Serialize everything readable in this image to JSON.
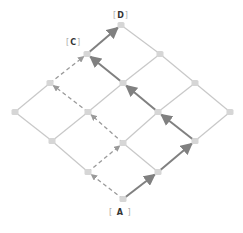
{
  "diagram": {
    "type": "lattice-path",
    "colors": {
      "grid_edge": "#c8c8c8",
      "node": "#d6d6d6",
      "solid_path": "#808080",
      "dashed_path": "#9a9a9a",
      "label_text": "#333333"
    },
    "labels": [
      {
        "id": "D",
        "text": "D",
        "x": 113,
        "y": 12
      },
      {
        "id": "C",
        "text": "C",
        "x": 66,
        "y": 39
      },
      {
        "id": "A",
        "text": "A",
        "x": 109,
        "y": 209
      }
    ],
    "nodes": [
      {
        "id": "n00",
        "x": 123,
        "y": 199
      },
      {
        "id": "n10",
        "x": 158,
        "y": 172
      },
      {
        "id": "n01",
        "x": 88,
        "y": 172
      },
      {
        "id": "n20",
        "x": 195,
        "y": 141
      },
      {
        "id": "n11",
        "x": 123,
        "y": 143
      },
      {
        "id": "n02",
        "x": 52,
        "y": 141
      },
      {
        "id": "n30",
        "x": 230,
        "y": 112
      },
      {
        "id": "n21",
        "x": 158,
        "y": 112
      },
      {
        "id": "n12",
        "x": 88,
        "y": 112
      },
      {
        "id": "n03",
        "x": 15,
        "y": 112
      },
      {
        "id": "n31",
        "x": 195,
        "y": 83
      },
      {
        "id": "n22",
        "x": 123,
        "y": 83
      },
      {
        "id": "n13",
        "x": 50,
        "y": 83
      },
      {
        "id": "n32",
        "x": 160,
        "y": 54
      },
      {
        "id": "n23",
        "x": 87,
        "y": 54
      },
      {
        "id": "n33",
        "x": 121,
        "y": 25
      }
    ],
    "solid_path": [
      "n00",
      "n10",
      "n20",
      "n21",
      "n22",
      "n23",
      "n33"
    ],
    "dashed_path": [
      "n00",
      "n01",
      "n11",
      "n12",
      "n13",
      "n23"
    ]
  }
}
